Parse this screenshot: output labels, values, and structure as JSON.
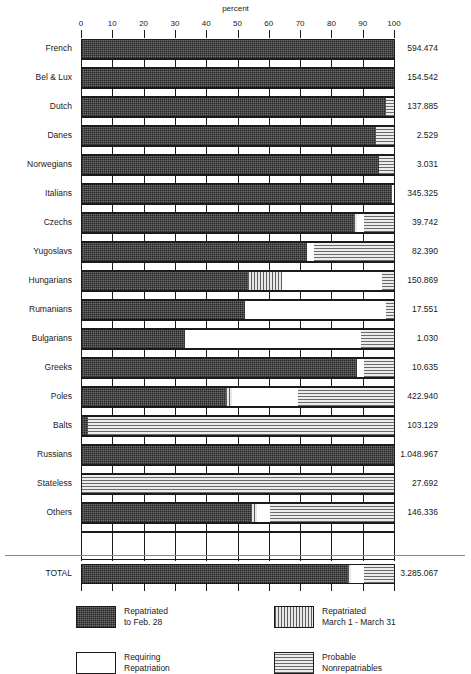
{
  "chart_data": {
    "type": "bar",
    "title": "",
    "xlabel": "percent",
    "ylabel": "",
    "xlim": [
      0,
      100
    ],
    "xticks": [
      0,
      10,
      20,
      30,
      40,
      50,
      60,
      70,
      80,
      90,
      100
    ],
    "grid": true,
    "orientation": "horizontal",
    "stacked": true,
    "legend_position": "bottom",
    "series": [
      {
        "name": "Repatriated to Feb. 28",
        "key": "repatriated_feb",
        "pattern": "cross-hatch-dark"
      },
      {
        "name": "Repatriated March 1 - March 31",
        "key": "repatriated_march",
        "pattern": "vertical-hatch"
      },
      {
        "name": "Requiring Repatriation",
        "key": "requiring",
        "pattern": "white"
      },
      {
        "name": "Probable Nonrepatriables",
        "key": "nonrepatriable",
        "pattern": "horizontal-hatch"
      }
    ],
    "categories": [
      "French",
      "Bel & Lux",
      "Dutch",
      "Danes",
      "Norwegians",
      "Italians",
      "Czechs",
      "Yugoslavs",
      "Hungarians",
      "Rumanians",
      "Bulgarians",
      "Greeks",
      "Poles",
      "Balts",
      "Russians",
      "Stateless",
      "Others"
    ],
    "total_row": {
      "label": "TOTAL",
      "value": "3.285.067",
      "percents": {
        "repatriated_feb": 85,
        "repatriated_march": 1,
        "requiring": 4,
        "nonrepatriable": 10
      }
    },
    "rows": [
      {
        "label": "French",
        "value": "594.474",
        "percents": {
          "repatriated_feb": 100,
          "repatriated_march": 0,
          "requiring": 0,
          "nonrepatriable": 0
        }
      },
      {
        "label": "Bel & Lux",
        "value": "154.542",
        "percents": {
          "repatriated_feb": 100,
          "repatriated_march": 0,
          "requiring": 0,
          "nonrepatriable": 0
        }
      },
      {
        "label": "Dutch",
        "value": "137.885",
        "percents": {
          "repatriated_feb": 97,
          "repatriated_march": 0,
          "requiring": 0,
          "nonrepatriable": 3
        }
      },
      {
        "label": "Danes",
        "value": "2.529",
        "percents": {
          "repatriated_feb": 94,
          "repatriated_march": 0,
          "requiring": 0,
          "nonrepatriable": 6
        }
      },
      {
        "label": "Norwegians",
        "value": "3.031",
        "percents": {
          "repatriated_feb": 95,
          "repatriated_march": 0,
          "requiring": 0,
          "nonrepatriable": 5
        }
      },
      {
        "label": "Italians",
        "value": "345.325",
        "percents": {
          "repatriated_feb": 99,
          "repatriated_march": 0,
          "requiring": 1,
          "nonrepatriable": 0
        }
      },
      {
        "label": "Czechs",
        "value": "39.742",
        "percents": {
          "repatriated_feb": 87,
          "repatriated_march": 1,
          "requiring": 2,
          "nonrepatriable": 10
        }
      },
      {
        "label": "Yugoslavs",
        "value": "82.390",
        "percents": {
          "repatriated_feb": 72,
          "repatriated_march": 0,
          "requiring": 2,
          "nonrepatriable": 26
        }
      },
      {
        "label": "Hungarians",
        "value": "150.869",
        "percents": {
          "repatriated_feb": 53,
          "repatriated_march": 11,
          "requiring": 32,
          "nonrepatriable": 4
        }
      },
      {
        "label": "Rumanians",
        "value": "17.551",
        "percents": {
          "repatriated_feb": 52,
          "repatriated_march": 0,
          "requiring": 45,
          "nonrepatriable": 3
        }
      },
      {
        "label": "Bulgarians",
        "value": "1.030",
        "percents": {
          "repatriated_feb": 33,
          "repatriated_march": 0,
          "requiring": 56,
          "nonrepatriable": 11
        }
      },
      {
        "label": "Greeks",
        "value": "10.635",
        "percents": {
          "repatriated_feb": 88,
          "repatriated_march": 0,
          "requiring": 2,
          "nonrepatriable": 10
        }
      },
      {
        "label": "Poles",
        "value": "422.940",
        "percents": {
          "repatriated_feb": 46,
          "repatriated_march": 2,
          "requiring": 21,
          "nonrepatriable": 31
        }
      },
      {
        "label": "Balts",
        "value": "103.129",
        "percents": {
          "repatriated_feb": 2,
          "repatriated_march": 0,
          "requiring": 0,
          "nonrepatriable": 98
        }
      },
      {
        "label": "Russians",
        "value": "1.048.967",
        "percents": {
          "repatriated_feb": 100,
          "repatriated_march": 0,
          "requiring": 0,
          "nonrepatriable": 0
        }
      },
      {
        "label": "Stateless",
        "value": "27.692",
        "percents": {
          "repatriated_feb": 0,
          "repatriated_march": 0,
          "requiring": 0,
          "nonrepatriable": 100
        }
      },
      {
        "label": "Others",
        "value": "146.336",
        "percents": {
          "repatriated_feb": 54,
          "repatriated_march": 2,
          "requiring": 4,
          "nonrepatriable": 40
        }
      }
    ]
  },
  "legend": [
    {
      "line1": "Repatriated",
      "line2": "to Feb. 28",
      "pattern": "cross-hatch-dark"
    },
    {
      "line1": "Repatriated",
      "line2": "March 1 - March 31",
      "pattern": "vertical-hatch"
    },
    {
      "line1": "Requiring",
      "line2": "Repatriation",
      "pattern": "white"
    },
    {
      "line1": "Probable",
      "line2": "Nonrepatriables",
      "pattern": "horizontal-hatch"
    }
  ],
  "colors": {
    "ink": "#1a1a1a",
    "dark_fill": "#6d6d6d",
    "hatch_fill": "#d8d8d8",
    "white_fill": "#ffffff",
    "rule": "#8a8a8a"
  }
}
